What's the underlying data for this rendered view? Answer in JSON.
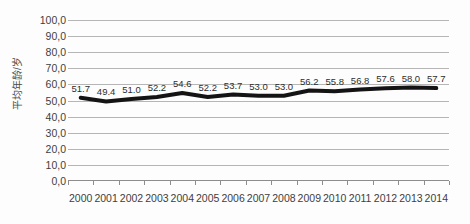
{
  "chart_data": {
    "type": "line",
    "title": "",
    "xlabel": "",
    "ylabel": "平均年龄/岁",
    "categories": [
      "2000",
      "2001",
      "2002",
      "2003",
      "2004",
      "2005",
      "2006",
      "2007",
      "2008",
      "2009",
      "2010",
      "2011",
      "2012",
      "2013",
      "2014"
    ],
    "values": [
      51.7,
      49.4,
      51.0,
      52.2,
      54.6,
      52.2,
      53.7,
      53.0,
      53.0,
      56.2,
      55.8,
      56.8,
      57.6,
      58.0,
      57.7
    ],
    "data_labels": [
      "51.7",
      "49.4",
      "51.0",
      "52.2",
      "54.6",
      "52.2",
      "53.7",
      "53.0",
      "53.0",
      "56.2",
      "55.8",
      "56.8",
      "57.6",
      "58.0",
      "57.7"
    ],
    "ylim": [
      0,
      100
    ],
    "ytick_values": [
      0,
      10,
      20,
      30,
      40,
      50,
      60,
      70,
      80,
      90,
      100
    ],
    "ytick_labels": [
      "0,0",
      "10,0",
      "20,0",
      "30,0",
      "40,0",
      "50,0",
      "60,0",
      "70,0",
      "80,0",
      "90,0",
      "100,0"
    ],
    "grid": true,
    "legend": "none",
    "series_color": "#141414",
    "gridline_color": "#b6b6b6",
    "background_color": "#fdfdfd"
  }
}
